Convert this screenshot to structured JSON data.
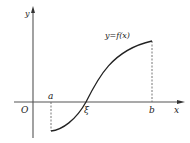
{
  "diagram": {
    "labels": {
      "y_axis": "y",
      "x_axis": "x",
      "origin": "O",
      "a": "a",
      "b": "b",
      "xi": "ξ",
      "curve": "y=f(x)"
    },
    "colors": {
      "axis": "#555555",
      "curve": "#222222",
      "dashed": "#666666"
    }
  }
}
